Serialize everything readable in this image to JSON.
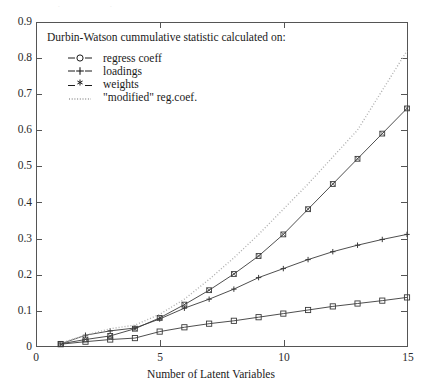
{
  "chart_data": {
    "type": "line",
    "title": "",
    "xlabel": "Number of Latent Variables",
    "ylabel": "",
    "xlim": [
      0,
      15
    ],
    "ylim": [
      0,
      0.9
    ],
    "xticks": [
      0,
      5,
      10,
      15
    ],
    "yticks": [
      "0",
      "0.1",
      "0.2",
      "0.3",
      "0.4",
      "0.5",
      "0.6",
      "0.7",
      "0.8",
      "0.9"
    ],
    "ytick_values": [
      0,
      0.1,
      0.2,
      0.3,
      0.4,
      0.5,
      0.6,
      0.7,
      0.8,
      0.9
    ],
    "grid": false,
    "legend_position": "upper-left",
    "legend_title": "Durbin-Watson cummulative statistic calculated on:",
    "x": [
      1,
      2,
      3,
      4,
      5,
      6,
      7,
      8,
      9,
      10,
      11,
      12,
      13,
      14,
      15
    ],
    "series": [
      {
        "name": "regress coeff",
        "marker": "-o-",
        "style": "solid",
        "values": [
          0.005,
          0.012,
          0.018,
          0.022,
          0.04,
          0.052,
          0.062,
          0.07,
          0.08,
          0.09,
          0.1,
          0.11,
          0.118,
          0.126,
          0.135
        ]
      },
      {
        "name": "loadings",
        "marker": "-+-",
        "style": "solid",
        "values": [
          0.006,
          0.03,
          0.042,
          0.05,
          0.075,
          0.105,
          0.13,
          0.158,
          0.19,
          0.215,
          0.24,
          0.262,
          0.28,
          0.296,
          0.31
        ]
      },
      {
        "name": "weights",
        "marker": "-*-",
        "style": "solid",
        "values": [
          0.006,
          0.018,
          0.028,
          0.048,
          0.078,
          0.115,
          0.155,
          0.2,
          0.25,
          0.31,
          0.38,
          0.45,
          0.52,
          0.59,
          0.66
        ]
      },
      {
        "name": "\"modified\" reg.coef.",
        "marker": "dotted",
        "style": "dotted",
        "values": [
          0.008,
          0.03,
          0.048,
          0.058,
          0.088,
          0.13,
          0.185,
          0.245,
          0.31,
          0.38,
          0.45,
          0.525,
          0.6,
          0.71,
          0.82
        ]
      }
    ],
    "legend_entries": [
      {
        "symbol": "-o-",
        "label": "regress coeff"
      },
      {
        "symbol": "-+-",
        "label": "loadings"
      },
      {
        "symbol": "-*-",
        "label": "weights"
      },
      {
        "symbol": "dotted",
        "label": "\"modified\" reg.coef."
      }
    ],
    "colors": {
      "axis": "#555555",
      "series_line": "#3a3a3a",
      "dotted_line": "#b0b0b0",
      "text": "#1a1a1a",
      "background": "#ffffff"
    }
  }
}
